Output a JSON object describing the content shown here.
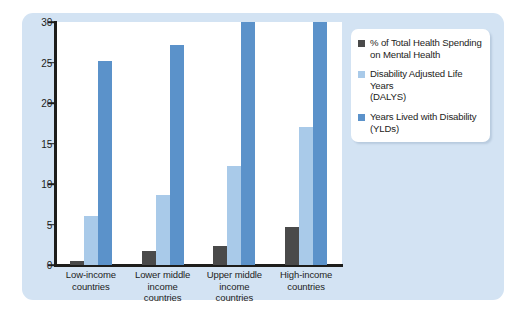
{
  "chart_data": {
    "type": "bar",
    "title": "",
    "subtitle": "",
    "xlabel": "",
    "ylabel": "",
    "ylim": [
      0,
      30
    ],
    "yticks": [
      0,
      5,
      10,
      15,
      20,
      25,
      30
    ],
    "grid": false,
    "legend_position": "top-right",
    "categories": [
      "Low-income countries",
      "Lower middle income countries",
      "Upper middle income countries",
      "High-income countries"
    ],
    "category_lines": [
      [
        "Low-income",
        "countries"
      ],
      [
        "Lower middle",
        "income",
        "countries"
      ],
      [
        "Upper middle",
        "income",
        "countries"
      ],
      [
        "High-income",
        "countries"
      ]
    ],
    "series": [
      {
        "name": "% of Total Health Spending on Mental Health",
        "color": "#4a4a4a",
        "values": [
          0.5,
          1.7,
          2.3,
          4.7
        ]
      },
      {
        "name": "Disability Adjusted Life Years (DALYS)",
        "color": "#a9cae9",
        "values": [
          6.1,
          8.6,
          12.2,
          17.0
        ]
      },
      {
        "name": "Years Lived with Disability (YLDs)",
        "color": "#5b92ca",
        "values": [
          25.2,
          27.2,
          30.0,
          30.0
        ]
      }
    ]
  },
  "legend": {
    "items": [
      {
        "line1": "% of Total Health Spending",
        "line2": "on Mental Health",
        "swatch": "#4a4a4a"
      },
      {
        "line1": "Disability Adjusted Life Years",
        "line2": "(DALYS)",
        "swatch": "#a9cae9"
      },
      {
        "line1": "Years Lived with Disability",
        "line2": "(YLDs)",
        "swatch": "#5b92ca"
      }
    ]
  },
  "colors": {
    "panel_background": "#d3e3f3",
    "plot_background": "#ffffff",
    "axis": "#1d1d1b",
    "series_spending": "#4a4a4a",
    "series_dalys": "#a9cae9",
    "series_ylds": "#5b92ca"
  }
}
